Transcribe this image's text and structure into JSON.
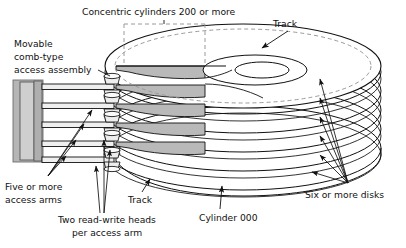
{
  "diagram": {
    "title_implied": "Magnetic disk pack structure",
    "type": "technical-line-diagram",
    "background_color": "#ffffff",
    "line_color": "#111111",
    "dashed_color": "#9a9a9a",
    "cutaway_fill": "#b9b9b9",
    "assembly_fill": "#b5b5b5",
    "assembly_fill_light": "#cfcfcf",
    "labels": {
      "concentric_cylinders": "Concentric cylinders 200 or more",
      "track_top": "Track",
      "movable_assembly_line1": "Movable",
      "movable_assembly_line2": "comb-type",
      "movable_assembly_line3": "access assembly",
      "access_arms_line1": "Five or more",
      "access_arms_line2": "access arms",
      "heads_line1": "Two read-write heads",
      "heads_line2": "per access arm",
      "track_bottom": "Track",
      "cylinder_000": "Cylinder 000",
      "six_or_more_disks": "Six or more disks"
    },
    "counts": {
      "disks": 6,
      "access_arms": 5,
      "heads_per_arm": 2,
      "cylinders": "200 or more",
      "disk_leader_arrows": 6
    }
  }
}
